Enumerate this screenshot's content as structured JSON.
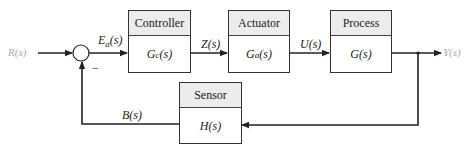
{
  "diagram": {
    "type": "feedback-control-block-diagram",
    "input_label": "R(s)",
    "output_label": "Y(s)",
    "error_signal": {
      "main": "E",
      "sub": "a",
      "tail": "(s)"
    },
    "summing_junction_sign": "−",
    "blocks": {
      "controller": {
        "title": "Controller",
        "tf_main": "G",
        "tf_sub": "c",
        "tf_tail": "(s)"
      },
      "actuator": {
        "title": "Actuator",
        "tf_main": "G",
        "tf_sub": "a",
        "tf_tail": "(s)"
      },
      "process": {
        "title": "Process",
        "tf_main": "G(s)"
      },
      "sensor": {
        "title": "Sensor",
        "tf_main": "H(s)"
      }
    },
    "signals": {
      "controller_out": "Z(s)",
      "actuator_out": "U(s)",
      "feedback": "B(s)"
    },
    "colors": {
      "line": "#222222",
      "header_fill": "#ececec",
      "io_label": "#aaaaaa"
    }
  }
}
